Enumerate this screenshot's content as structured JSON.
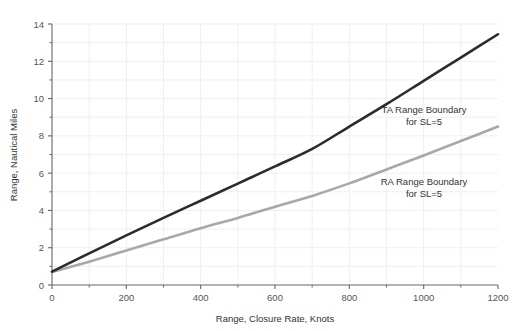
{
  "chart_data": {
    "type": "line",
    "title": "",
    "xlabel": "Range, Closure Rate, Knots",
    "ylabel": "Range, Nautical Miles",
    "xlim": [
      0,
      1200
    ],
    "ylim": [
      0,
      14
    ],
    "grid": true,
    "legend_position": "inline-annotations",
    "xticks": [
      0,
      200,
      400,
      600,
      800,
      1000,
      1200
    ],
    "xtick_labels": [
      "0",
      "200",
      "400",
      "600",
      "800",
      "1000",
      "1200"
    ],
    "x_minor_ticks": [
      100,
      300,
      500,
      700,
      900,
      1100
    ],
    "yticks": [
      0,
      2,
      4,
      6,
      8,
      10,
      12,
      14
    ],
    "ytick_labels": [
      "0",
      "2",
      "4",
      "6",
      "8",
      "10",
      "12",
      "14"
    ],
    "y_minor_ticks": [
      1,
      3,
      5,
      7,
      9,
      11,
      13
    ],
    "x": [
      0,
      100,
      200,
      300,
      400,
      500,
      600,
      700,
      800,
      900,
      1000,
      1100,
      1200
    ],
    "series": [
      {
        "name": "TA Range Boundary for SL=5",
        "color": "#2b2b2b",
        "width": 2.6,
        "values": [
          0.72,
          1.7,
          2.66,
          3.6,
          4.52,
          5.44,
          6.36,
          7.3,
          8.5,
          9.7,
          10.95,
          12.2,
          13.45
        ]
      },
      {
        "name": "RA Range Boundary for SL=5",
        "color": "#a8a8a8",
        "width": 2.6,
        "values": [
          0.7,
          1.25,
          1.85,
          2.45,
          3.05,
          3.6,
          4.2,
          4.78,
          5.45,
          6.2,
          6.95,
          7.72,
          8.5
        ]
      }
    ],
    "annotations": [
      {
        "name": "ta-range-boundary-annotation",
        "line1": "TA Range Boundary",
        "line2": "for SL=5",
        "x_px": 424,
        "y_px": 113
      },
      {
        "name": "ra-range-boundary-annotation",
        "line1": "RA Range Boundary",
        "line2": "for SL=5",
        "x_px": 424,
        "y_px": 185
      }
    ],
    "colors": {
      "background": "#ffffff",
      "grid": "#efefef",
      "axis": "#666666",
      "ta_curve": "#2b2b2b",
      "ra_curve": "#a8a8a8",
      "text": "#444444"
    }
  }
}
